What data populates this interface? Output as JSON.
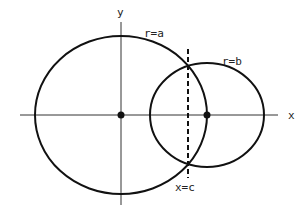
{
  "diagram": {
    "type": "intersecting-circles",
    "axes": {
      "x_label": "x",
      "y_label": "y"
    },
    "circles": [
      {
        "label": "r=a",
        "center": "origin"
      },
      {
        "label": "r=b",
        "center": "on positive x-axis"
      }
    ],
    "line": {
      "label": "x=c",
      "style": "dashed",
      "orientation": "vertical"
    },
    "colors": {
      "stroke": "#111111",
      "background": "#ffffff"
    }
  }
}
